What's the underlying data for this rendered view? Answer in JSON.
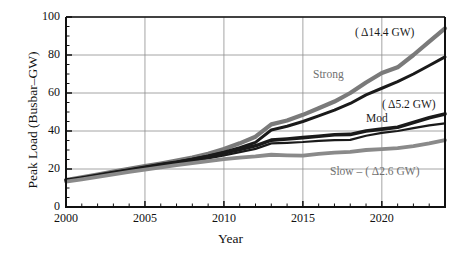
{
  "chart_data": {
    "type": "line",
    "title": "",
    "xlabel": "Year",
    "ylabel": "Peak Load (Busbar–GW)",
    "xlim": [
      2000,
      2024
    ],
    "ylim": [
      0,
      100
    ],
    "grid": true,
    "legend_position": "inline-annotations",
    "ytick_labels": [
      "0",
      "20",
      "40",
      "60",
      "80",
      "100"
    ],
    "ytick_values": [
      0,
      20,
      40,
      60,
      80,
      100
    ],
    "xtick_labels": [
      "2000",
      "2005",
      "2010",
      "2015",
      "2020"
    ],
    "xtick_values": [
      2000,
      2005,
      2010,
      2015,
      2020
    ],
    "x": [
      2000,
      2001,
      2002,
      2003,
      2004,
      2005,
      2006,
      2007,
      2008,
      2009,
      2010,
      2011,
      2012,
      2013,
      2014,
      2015,
      2016,
      2017,
      2018,
      2019,
      2020,
      2021,
      2022,
      2023,
      2024
    ],
    "series": [
      {
        "name": "Strong-upper",
        "label": "Strong",
        "color": "#7a7a7a",
        "width": 4.2,
        "delta_label": "( Δ14.4 GW)",
        "values": [
          14.2,
          15.6,
          17.1,
          18.6,
          20.1,
          21.5,
          22.9,
          24.4,
          26.0,
          28.0,
          30.5,
          33.5,
          37.0,
          43.5,
          45.5,
          48.5,
          52.0,
          55.5,
          60.0,
          65.5,
          70.5,
          73.5,
          80.0,
          87.0,
          94.0
        ]
      },
      {
        "name": "Strong-lower",
        "label": "",
        "color": "#1a1a1a",
        "width": 3.0,
        "delta_label": "",
        "values": [
          13.8,
          15.1,
          16.5,
          18.0,
          19.4,
          20.8,
          22.2,
          23.6,
          25.2,
          26.8,
          28.8,
          31.2,
          34.0,
          40.5,
          42.5,
          45.0,
          48.0,
          51.0,
          54.5,
          59.0,
          62.5,
          66.0,
          70.0,
          74.5,
          79.0
        ]
      },
      {
        "name": "Mod-upper",
        "label": "Mod",
        "color": "#1a1a1a",
        "width": 3.6,
        "delta_label": "( Δ5.2 GW)",
        "values": [
          14.0,
          15.3,
          16.7,
          18.1,
          19.5,
          20.9,
          22.3,
          23.6,
          25.0,
          26.6,
          28.4,
          30.3,
          32.2,
          35.2,
          35.8,
          36.5,
          37.2,
          38.0,
          38.2,
          40.0,
          41.0,
          42.0,
          44.5,
          47.0,
          49.0
        ]
      },
      {
        "name": "Mod-lower",
        "label": "",
        "color": "#1a1a1a",
        "width": 2.2,
        "delta_label": "",
        "values": [
          13.6,
          14.8,
          16.1,
          17.5,
          18.9,
          20.2,
          21.5,
          22.8,
          24.2,
          25.6,
          27.2,
          28.9,
          30.6,
          33.5,
          33.8,
          34.2,
          34.8,
          35.2,
          35.3,
          37.5,
          39.0,
          40.0,
          41.5,
          43.0,
          44.0
        ]
      },
      {
        "name": "Slow",
        "label": "Slow",
        "color": "#8a8a8a",
        "width": 3.8,
        "delta_label": "( Δ2.6 GW)",
        "values": [
          13.4,
          14.6,
          15.9,
          17.2,
          18.5,
          19.7,
          20.9,
          22.0,
          23.1,
          24.2,
          25.2,
          26.0,
          26.6,
          27.5,
          27.2,
          27.0,
          28.0,
          28.6,
          29.0,
          30.0,
          30.5,
          31.0,
          32.0,
          33.5,
          35.2
        ]
      }
    ],
    "annotations": [
      {
        "name": "strong-delta",
        "text": "( Δ14.4 GW)",
        "x_px": 355,
        "y_px": 26,
        "tone": "dark"
      },
      {
        "name": "strong-label",
        "text": "Strong",
        "x_px": 313,
        "y_px": 68,
        "tone": "gray"
      },
      {
        "name": "mod-delta",
        "text": "( Δ5.2 GW)",
        "x_px": 382,
        "y_px": 98,
        "tone": "dark"
      },
      {
        "name": "mod-label",
        "text": "Mod",
        "x_px": 366,
        "y_px": 112,
        "tone": "dark"
      },
      {
        "name": "slow-label",
        "text": "Slow  –  ( Δ2.6 GW)",
        "x_px": 330,
        "y_px": 165,
        "tone": "gray"
      }
    ]
  }
}
